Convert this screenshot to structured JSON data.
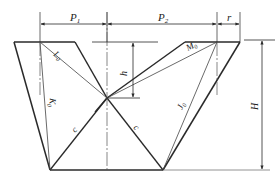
{
  "diagram": {
    "type": "technical-drawing",
    "colors": {
      "line": "#2a2a2a",
      "thin_line": "#555555",
      "background": "#ffffff"
    },
    "dimensions": {
      "P1": {
        "label": "P",
        "subscript": "1"
      },
      "P2": {
        "label": "P",
        "subscript": "2"
      },
      "r": {
        "label": "r"
      },
      "h": {
        "label": "h"
      },
      "H": {
        "label": "H"
      }
    },
    "segments": {
      "L0": {
        "label": "L",
        "subscript": "0"
      },
      "M0": {
        "label": "M",
        "subscript": "0"
      },
      "K0": {
        "label": "K",
        "subscript": "0"
      },
      "J0": {
        "label": "J",
        "subscript": "0"
      },
      "c_left": {
        "label": "c"
      },
      "c_right": {
        "label": "c"
      }
    }
  }
}
